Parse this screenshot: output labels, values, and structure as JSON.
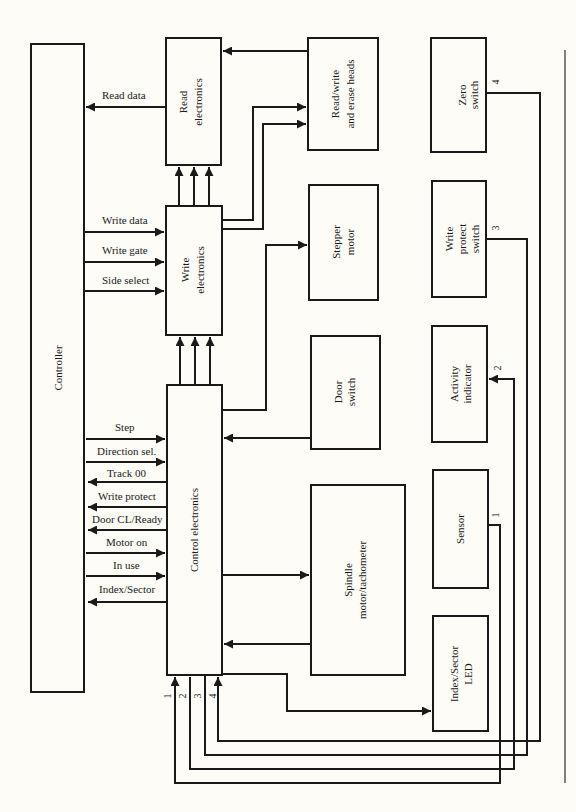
{
  "diagram": {
    "blocks": {
      "controller": "Controller",
      "read_electronics": [
        "Read",
        "electronics"
      ],
      "rw_heads": [
        "Read/write",
        "and erase heads"
      ],
      "zero_switch": [
        "Zero",
        "switch"
      ],
      "write_electronics": [
        "Write",
        "electronics"
      ],
      "stepper_motor": [
        "Stepper",
        "motor"
      ],
      "write_protect_switch": [
        "Write",
        "protect",
        "switch"
      ],
      "door_switch": [
        "Door",
        "switch"
      ],
      "activity_indicator": [
        "Activity",
        "indicator"
      ],
      "control_electronics": "Control electronics",
      "spindle_motor": [
        "Spindle",
        "motor/tachometer"
      ],
      "sensor": "Sensor",
      "index_sector_led": [
        "Index/Sector",
        "LED"
      ]
    },
    "signals": {
      "read_data": "Read data",
      "write_data": "Write data",
      "write_gate": "Write gate",
      "side_select": "Side select",
      "step": "Step",
      "direction_sel": "Direction sel.",
      "track_00": "Track 00",
      "write_protect": "Write protect",
      "door_cl_ready": "Door CL/Ready",
      "motor_on": "Motor on",
      "in_use": "In use",
      "index_sector": "Index/Sector"
    },
    "line_numbers": {
      "n1": "1",
      "n2": "2",
      "n3": "3",
      "n4": "4"
    }
  }
}
